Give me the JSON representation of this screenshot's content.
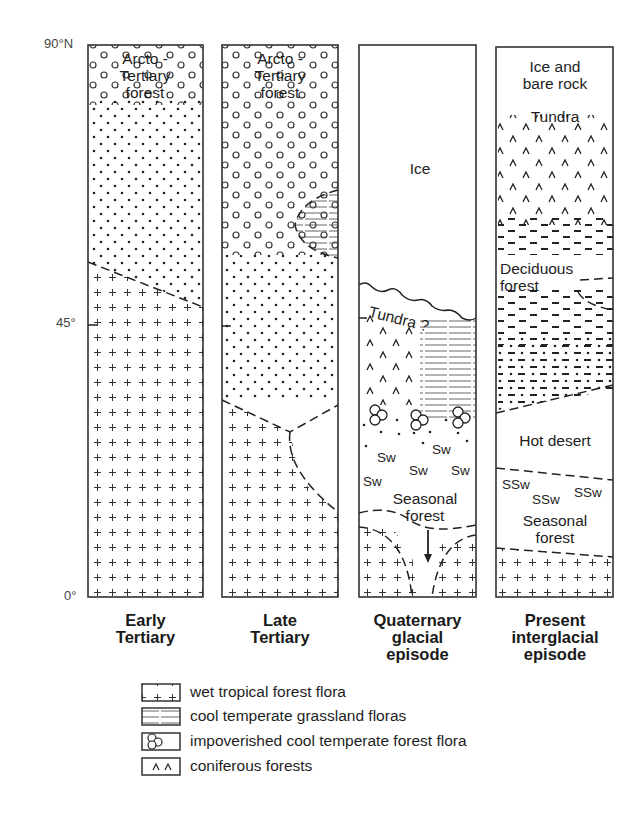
{
  "axis": {
    "top_label": "90°N",
    "mid_label": "45°",
    "bottom_label": "0°"
  },
  "columns": [
    {
      "title_line1": "Early",
      "title_line2": "Tertiary",
      "zones": {
        "arcto": [
          "Arcto -",
          "Tertiary",
          "forest"
        ]
      }
    },
    {
      "title_line1": "Late",
      "title_line2": "Tertiary",
      "zones": {
        "arcto": [
          "Arcto -",
          "Tertiary",
          "forest"
        ]
      }
    },
    {
      "title_line1": "Quaternary",
      "title_line2": "glacial",
      "title_line3": "episode",
      "zones": {
        "ice": "Ice",
        "tundra": "Tundra ?",
        "sw": "Sw",
        "seasonal": [
          "Seasonal",
          "forest"
        ]
      }
    },
    {
      "title_line1": "Present",
      "title_line2": "interglacial",
      "title_line3": "episode",
      "zones": {
        "ice": [
          "Ice and",
          "bare rock"
        ],
        "tundra": "Tundra",
        "deciduous": [
          "Deciduous",
          "forest"
        ],
        "desert": "Hot desert",
        "ssw": "SSw",
        "seasonal": [
          "Seasonal",
          "forest"
        ]
      }
    }
  ],
  "legend": [
    {
      "symbol": "plus-pattern",
      "label": "wet tropical forest flora"
    },
    {
      "symbol": "hatched-lines",
      "label": "cool temperate grassland floras"
    },
    {
      "symbol": "triple-circles",
      "label": "impoverished cool temperate forest flora"
    },
    {
      "symbol": "caret-marks",
      "label": "coniferous forests"
    }
  ]
}
